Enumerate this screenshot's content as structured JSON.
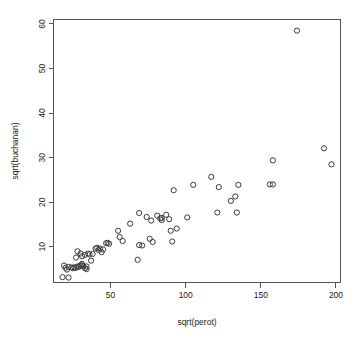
{
  "chart_data": {
    "type": "scatter",
    "title": "",
    "xlabel": "sqrt(perot)",
    "ylabel": "sqrt(buchanan)",
    "xlim": [
      12,
      203
    ],
    "ylim": [
      2,
      61
    ],
    "xticks": [
      50,
      100,
      150,
      200
    ],
    "yticks": [
      10,
      20,
      30,
      40,
      50,
      60
    ],
    "grid": false,
    "legend": null,
    "marker": "open-circle",
    "marker_color": "#3a3a3a",
    "points": [
      {
        "x": 18,
        "y": 3.2
      },
      {
        "x": 22,
        "y": 3.1
      },
      {
        "x": 19,
        "y": 5.8
      },
      {
        "x": 20,
        "y": 5.3
      },
      {
        "x": 21,
        "y": 4.9
      },
      {
        "x": 22,
        "y": 5.5
      },
      {
        "x": 24,
        "y": 5.4
      },
      {
        "x": 25,
        "y": 5.2
      },
      {
        "x": 26,
        "y": 5.4
      },
      {
        "x": 27,
        "y": 5.3
      },
      {
        "x": 28,
        "y": 5.6
      },
      {
        "x": 29,
        "y": 5.5
      },
      {
        "x": 30,
        "y": 5.9
      },
      {
        "x": 31,
        "y": 5.8
      },
      {
        "x": 31,
        "y": 6.2
      },
      {
        "x": 32,
        "y": 5.6
      },
      {
        "x": 33,
        "y": 5.2
      },
      {
        "x": 34,
        "y": 5.0
      },
      {
        "x": 34,
        "y": 5.6
      },
      {
        "x": 27,
        "y": 7.6
      },
      {
        "x": 28,
        "y": 9.0
      },
      {
        "x": 30,
        "y": 8.5
      },
      {
        "x": 31,
        "y": 7.9
      },
      {
        "x": 33,
        "y": 8.2
      },
      {
        "x": 35,
        "y": 8.5
      },
      {
        "x": 36,
        "y": 8.3
      },
      {
        "x": 38,
        "y": 8.4
      },
      {
        "x": 37,
        "y": 6.9
      },
      {
        "x": 40,
        "y": 9.6
      },
      {
        "x": 41,
        "y": 9.8
      },
      {
        "x": 42,
        "y": 9.3
      },
      {
        "x": 43,
        "y": 9.6
      },
      {
        "x": 44,
        "y": 8.8
      },
      {
        "x": 45,
        "y": 9.4
      },
      {
        "x": 47,
        "y": 10.8
      },
      {
        "x": 48,
        "y": 10.9
      },
      {
        "x": 49,
        "y": 10.7
      },
      {
        "x": 55,
        "y": 13.6
      },
      {
        "x": 56,
        "y": 12.2
      },
      {
        "x": 58,
        "y": 11.3
      },
      {
        "x": 63,
        "y": 15.2
      },
      {
        "x": 68,
        "y": 7.1
      },
      {
        "x": 69,
        "y": 10.4
      },
      {
        "x": 71,
        "y": 10.3
      },
      {
        "x": 69,
        "y": 17.6
      },
      {
        "x": 74,
        "y": 16.7
      },
      {
        "x": 77,
        "y": 15.9
      },
      {
        "x": 76,
        "y": 11.8
      },
      {
        "x": 78,
        "y": 11.1
      },
      {
        "x": 81,
        "y": 17.0
      },
      {
        "x": 83,
        "y": 16.4
      },
      {
        "x": 84,
        "y": 16.5
      },
      {
        "x": 84,
        "y": 16.0
      },
      {
        "x": 87,
        "y": 17.2
      },
      {
        "x": 89,
        "y": 16.2
      },
      {
        "x": 90,
        "y": 13.6
      },
      {
        "x": 91,
        "y": 11.2
      },
      {
        "x": 92,
        "y": 22.7
      },
      {
        "x": 94,
        "y": 14.1
      },
      {
        "x": 101,
        "y": 16.6
      },
      {
        "x": 105,
        "y": 23.9
      },
      {
        "x": 117,
        "y": 25.7
      },
      {
        "x": 121,
        "y": 17.7
      },
      {
        "x": 122,
        "y": 23.4
      },
      {
        "x": 130,
        "y": 20.3
      },
      {
        "x": 133,
        "y": 21.3
      },
      {
        "x": 134,
        "y": 17.7
      },
      {
        "x": 135,
        "y": 23.9
      },
      {
        "x": 156,
        "y": 24.0
      },
      {
        "x": 158,
        "y": 24.0
      },
      {
        "x": 158,
        "y": 29.4
      },
      {
        "x": 174,
        "y": 58.5
      },
      {
        "x": 192,
        "y": 32.1
      },
      {
        "x": 197,
        "y": 28.5
      }
    ]
  },
  "axes": {
    "x_tick_labels": [
      "50",
      "100",
      "150",
      "200"
    ],
    "y_tick_labels": [
      "10",
      "20",
      "30",
      "40",
      "50",
      "60"
    ],
    "x_axis_title": "sqrt(perot)",
    "y_axis_title": "sqrt(buchanan)"
  }
}
